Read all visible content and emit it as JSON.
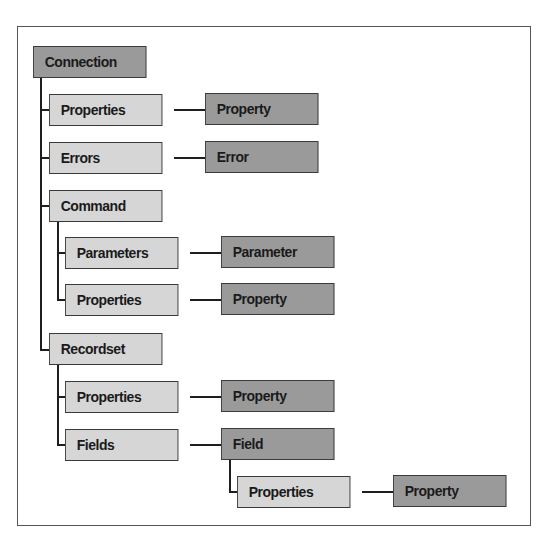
{
  "diagram": {
    "colors": {
      "collection_fill": "#d6d6d6",
      "object_fill": "#9a9a9a",
      "border": "#3a3a3a",
      "connector": "#1e1e1e"
    },
    "root": {
      "label": "Connection",
      "children": [
        {
          "collection": "Properties",
          "object": "Property"
        },
        {
          "collection": "Errors",
          "object": "Error"
        },
        {
          "object": "Command",
          "children": [
            {
              "collection": "Parameters",
              "object": "Parameter"
            },
            {
              "collection": "Properties",
              "object": "Property"
            }
          ]
        },
        {
          "object": "Recordset",
          "children": [
            {
              "collection": "Properties",
              "object": "Property"
            },
            {
              "collection": "Fields",
              "object": "Field",
              "children": [
                {
                  "collection": "Properties",
                  "object": "Property"
                }
              ]
            }
          ]
        }
      ]
    },
    "nodes": {
      "connection": "Connection",
      "conn_properties": "Properties",
      "conn_property": "Property",
      "conn_errors": "Errors",
      "conn_error": "Error",
      "command": "Command",
      "cmd_parameters": "Parameters",
      "cmd_parameter": "Parameter",
      "cmd_properties": "Properties",
      "cmd_property": "Property",
      "recordset": "Recordset",
      "rs_properties": "Properties",
      "rs_property": "Property",
      "rs_fields": "Fields",
      "rs_field": "Field",
      "field_properties": "Properties",
      "field_property": "Property"
    }
  }
}
